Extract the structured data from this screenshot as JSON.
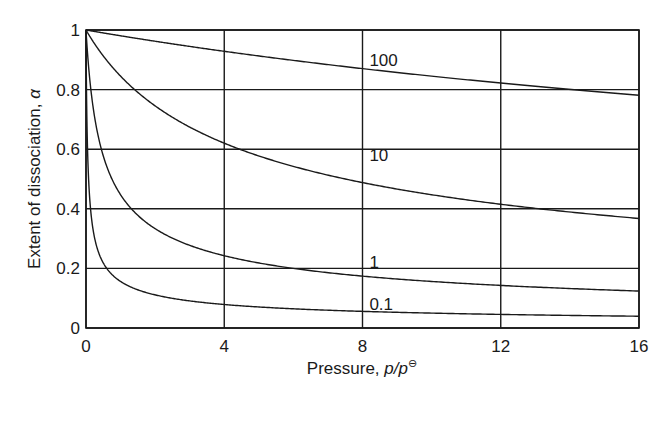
{
  "chart_data": {
    "type": "line",
    "title": "",
    "xlabel": "Pressure, p/p⊖",
    "xlabel_main": "Pressure, ",
    "xlabel_var": "p/p",
    "xlabel_sup": "⊖",
    "ylabel": "Extent of dissociation, α",
    "ylabel_main": "Extent of dissociation, ",
    "ylabel_var": "α",
    "xlim": [
      0,
      16
    ],
    "ylim": [
      0,
      1
    ],
    "xticks": [
      "0",
      "4",
      "8",
      "12",
      "16"
    ],
    "yticks": [
      "0",
      "0.2",
      "0.4",
      "0.6",
      "0.8",
      "1"
    ],
    "grid": true,
    "legend": "inline curve labels",
    "x": [
      0,
      0.25,
      0.5,
      1,
      2,
      4,
      8,
      12,
      16
    ],
    "series": [
      {
        "name": "100",
        "K": 100,
        "values": [
          1.0,
          0.995,
          0.99,
          0.981,
          0.962,
          0.928,
          0.87,
          0.822,
          0.781
        ]
      },
      {
        "name": "10",
        "K": 10,
        "values": [
          1.0,
          0.953,
          0.913,
          0.845,
          0.745,
          0.62,
          0.488,
          0.415,
          0.368
        ]
      },
      {
        "name": "1",
        "K": 1,
        "values": [
          1.0,
          0.707,
          0.577,
          0.447,
          0.333,
          0.243,
          0.175,
          0.143,
          0.124
        ]
      },
      {
        "name": "0.1",
        "K": 0.1,
        "values": [
          1.0,
          0.302,
          0.218,
          0.156,
          0.111,
          0.079,
          0.056,
          0.046,
          0.04
        ]
      }
    ],
    "label_positions": [
      {
        "text": "100",
        "x": 8.2,
        "y": 0.9
      },
      {
        "text": "10",
        "x": 8.2,
        "y": 0.58
      },
      {
        "text": "1",
        "x": 8.2,
        "y": 0.22
      },
      {
        "text": "0.1",
        "x": 8.2,
        "y": 0.08
      }
    ]
  }
}
